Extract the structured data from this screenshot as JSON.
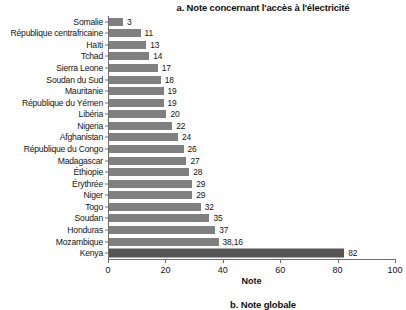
{
  "chart_data": {
    "type": "bar",
    "orientation": "horizontal",
    "title": "a. Note concernant l'accès à l'électricité",
    "xlabel": "Note",
    "ylabel": "",
    "xlim": [
      0,
      100
    ],
    "xticks": [
      0,
      20,
      40,
      60,
      80,
      100
    ],
    "grid": false,
    "legend": null,
    "categories": [
      "Somalie",
      "République centrafricaine",
      "Haïti",
      "Tchad",
      "Sierra Leone",
      "Soudan du Sud",
      "Mauritanie",
      "République du Yémen",
      "Libéria",
      "Nigeria",
      "Afghanistan",
      "République du Congo",
      "Madagascar",
      "Éthiopie",
      "Érythrée",
      "Niger",
      "Togo",
      "Soudan",
      "Honduras",
      "Mozambique",
      "Kenya"
    ],
    "values": [
      3,
      11,
      13,
      14,
      17,
      18,
      19,
      19,
      20,
      22,
      24,
      26,
      27,
      28,
      29,
      29,
      32,
      35,
      37,
      38.16,
      82
    ],
    "value_labels": [
      "3",
      "11",
      "13",
      "14",
      "17",
      "18",
      "19",
      "19",
      "20",
      "22",
      "24",
      "26",
      "27",
      "28",
      "29",
      "29",
      "32",
      "35",
      "37",
      "38,16",
      "82"
    ],
    "highlight_category": "Kenya",
    "colors": {
      "bar": "#808080",
      "bar_highlight": "#555555",
      "axis": "#6e6e6e",
      "text": "#141414",
      "background": "#ffffff"
    }
  },
  "next_panel": {
    "title": "b. Note globale"
  }
}
